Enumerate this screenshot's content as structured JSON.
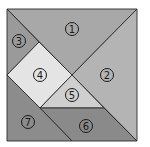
{
  "diagram": {
    "type": "tangram",
    "square": {
      "x": 7,
      "y": 9,
      "size": 130
    },
    "pieces": [
      {
        "id": 1,
        "label": "①",
        "fill": "#a8a8a8",
        "points": "7,9 137,9 72,75",
        "label_pos": [
          72,
          29
        ]
      },
      {
        "id": 2,
        "label": "②",
        "fill": "#b4b4b4",
        "points": "137,9 137,141 72,75",
        "label_pos": [
          107,
          75
        ]
      },
      {
        "id": 3,
        "label": "③",
        "fill": "#9a9a9a",
        "points": "7,9 39,42 7,75",
        "label_pos": [
          19,
          41
        ]
      },
      {
        "id": 4,
        "label": "④",
        "fill": "#e4e4e4",
        "points": "39,42 72,75 40,108 7,75",
        "label_pos": [
          40,
          75
        ]
      },
      {
        "id": 5,
        "label": "⑤",
        "fill": "#cfcfcf",
        "points": "72,75 104,108 40,108",
        "label_pos": [
          72,
          95
        ]
      },
      {
        "id": 6,
        "label": "⑥",
        "fill": "#8a8a8a",
        "points": "40,108 104,108 137,141 72,141",
        "label_pos": [
          86,
          126
        ]
      },
      {
        "id": 7,
        "label": "⑦",
        "fill": "#8c8c8c",
        "points": "7,75 40,108 72,141 7,141",
        "label_pos": [
          28,
          122
        ]
      }
    ]
  }
}
